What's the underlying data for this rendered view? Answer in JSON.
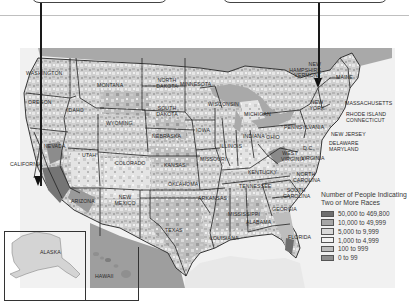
{
  "callouts": [
    {
      "id": "left",
      "text": ""
    },
    {
      "id": "right",
      "text": ""
    }
  ],
  "map": {
    "states": {
      "washington": "WASHINGTON",
      "oregon": "OREGON",
      "california": "CALIFORNIA",
      "nevada": "NEVADA",
      "idaho": "IDAHO",
      "montana": "MONTANA",
      "wyoming": "WYOMING",
      "utah": "UTAH",
      "arizona": "ARIZONA",
      "colorado": "COLORADO",
      "new_mexico": "NEW MEXICO",
      "north_dakota": "NORTH DAKOTA",
      "south_dakota": "SOUTH DAKOTA",
      "nebraska": "NEBRASKA",
      "kansas": "KANSAS",
      "oklahoma": "OKLAHOMA",
      "texas": "TEXAS",
      "minnesota": "MINNESOTA",
      "iowa": "IOWA",
      "missouri": "MISSOURI",
      "arkansas": "ARKANSAS",
      "louisiana": "LOUISIANA",
      "wisconsin": "WISCONSIN",
      "illinois": "ILLINOIS",
      "michigan": "MICHIGAN",
      "indiana": "INDIANA",
      "ohio": "OHIO",
      "kentucky": "KENTUCKY",
      "tennessee": "TENNESSEE",
      "mississippi": "MISSISSIPPI",
      "alabama": "ALABAMA",
      "georgia": "GEORGIA",
      "florida": "FLORIDA",
      "south_carolina": "SOUTH CAROLINA",
      "north_carolina": "NORTH CAROLINA",
      "virginia": "VIRGINIA",
      "west_virginia": "WEST VIRGINIA",
      "dc": "D.C.",
      "pennsylvania": "PENNSYLVANIA",
      "new_york": "NEW YORK",
      "new_jersey": "NEW JERSEY",
      "delaware_maryland": "DELAWARE MARYLAND",
      "massachusetts": "MASSACHUSETTS",
      "rhode_island_connecticut": "RHODE ISLAND CONNECTICUT",
      "nh_vermont": "NEW HAMPSHIRE VERMONT",
      "maine": "MAINE",
      "alaska": "ALASKA",
      "hawaii": "HAWAII"
    }
  },
  "legend": {
    "title": "Number of People Indicating Two or More Races",
    "items": [
      {
        "label": "50,000 to 469,800",
        "color": "#6e6e6e"
      },
      {
        "label": "10,000 to 49,999",
        "color": "#a6a6a6"
      },
      {
        "label": "5,000 to 9,999",
        "color": "#d9d9d9"
      },
      {
        "label": "1,000 to 4,999",
        "color": "#f2f2f2"
      },
      {
        "label": "100 to 999",
        "color": "#bdbdbd"
      },
      {
        "label": "0 to 99",
        "color": "#8f8f8f"
      }
    ]
  },
  "colors": {
    "water": "#a3a3a3",
    "land_light": "#dcdcdc",
    "land_mid": "#c2c2c2",
    "land_dark": "#8a8a8a",
    "border": "#222222"
  }
}
